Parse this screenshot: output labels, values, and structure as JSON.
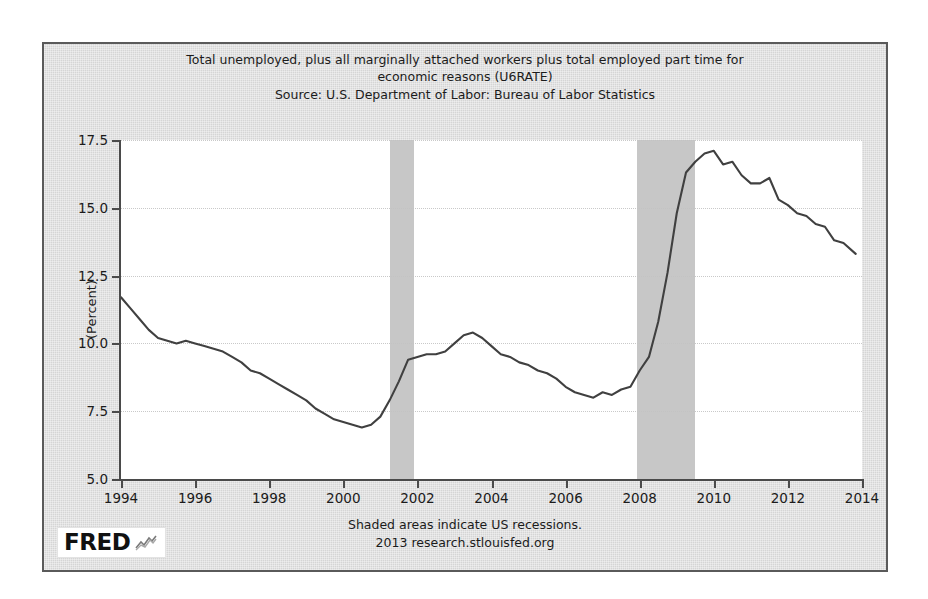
{
  "chart_data": {
    "type": "line",
    "title": "Total unemployed, plus all marginally attached workers plus total employed part time for economic reasons (U6RATE)",
    "title_line1": "Total unemployed, plus all marginally attached workers plus total employed part time for",
    "title_line2": "economic reasons (U6RATE)",
    "source": "Source: U.S. Department of Labor: Bureau of Labor Statistics",
    "xlabel": "",
    "ylabel": "(Percent)",
    "xlim": [
      1994,
      2014
    ],
    "ylim": [
      5.0,
      17.5
    ],
    "yticks": [
      "17.5",
      "15.0",
      "12.5",
      "10.0",
      "7.5",
      "5.0"
    ],
    "ytick_values": [
      17.5,
      15.0,
      12.5,
      10.0,
      7.5,
      5.0
    ],
    "xticks": [
      "1994",
      "1996",
      "1998",
      "2000",
      "2002",
      "2004",
      "2006",
      "2008",
      "2010",
      "2012",
      "2014"
    ],
    "xtick_values": [
      1994,
      1996,
      1998,
      2000,
      2002,
      2004,
      2006,
      2008,
      2010,
      2012,
      2014
    ],
    "grid": true,
    "legend": "none",
    "line_color": "#404040",
    "recession_color": "#c2c2c2",
    "background_color": "#d5d5d5",
    "plot_background": "#ffffff",
    "recessions": [
      {
        "start": 2001.25,
        "end": 2001.92
      },
      {
        "start": 2007.92,
        "end": 2009.5
      }
    ],
    "annotations": [
      "Shaded areas indicate US recessions.",
      "2013 research.stlouisfed.org"
    ],
    "series": [
      {
        "name": "U6RATE",
        "x": [
          1994.0,
          1994.25,
          1994.5,
          1994.75,
          1995.0,
          1995.25,
          1995.5,
          1995.75,
          1996.0,
          1996.25,
          1996.5,
          1996.75,
          1997.0,
          1997.25,
          1997.5,
          1997.75,
          1998.0,
          1998.25,
          1998.5,
          1998.75,
          1999.0,
          1999.25,
          1999.5,
          1999.75,
          2000.0,
          2000.25,
          2000.5,
          2000.75,
          2001.0,
          2001.25,
          2001.5,
          2001.75,
          2002.0,
          2002.25,
          2002.5,
          2002.75,
          2003.0,
          2003.25,
          2003.5,
          2003.75,
          2004.0,
          2004.25,
          2004.5,
          2004.75,
          2005.0,
          2005.25,
          2005.5,
          2005.75,
          2006.0,
          2006.25,
          2006.5,
          2006.75,
          2007.0,
          2007.25,
          2007.5,
          2007.75,
          2008.0,
          2008.25,
          2008.5,
          2008.75,
          2009.0,
          2009.25,
          2009.5,
          2009.75,
          2010.0,
          2010.25,
          2010.5,
          2010.75,
          2011.0,
          2011.25,
          2011.5,
          2011.75,
          2012.0,
          2012.25,
          2012.5,
          2012.75,
          2013.0,
          2013.25,
          2013.5,
          2013.83
        ],
        "values": [
          11.7,
          11.3,
          10.9,
          10.5,
          10.2,
          10.1,
          10.0,
          10.1,
          10.0,
          9.9,
          9.8,
          9.7,
          9.5,
          9.3,
          9.0,
          8.9,
          8.7,
          8.5,
          8.3,
          8.1,
          7.9,
          7.6,
          7.4,
          7.2,
          7.1,
          7.0,
          6.9,
          7.0,
          7.3,
          7.9,
          8.6,
          9.4,
          9.5,
          9.6,
          9.6,
          9.7,
          10.0,
          10.3,
          10.4,
          10.2,
          9.9,
          9.6,
          9.5,
          9.3,
          9.2,
          9.0,
          8.9,
          8.7,
          8.4,
          8.2,
          8.1,
          8.0,
          8.2,
          8.1,
          8.3,
          8.4,
          9.0,
          9.5,
          10.8,
          12.6,
          14.8,
          16.3,
          16.7,
          17.0,
          17.1,
          16.6,
          16.7,
          16.2,
          15.9,
          15.9,
          16.1,
          15.3,
          15.1,
          14.8,
          14.7,
          14.4,
          14.3,
          13.8,
          13.7,
          13.3
        ]
      }
    ]
  }
}
